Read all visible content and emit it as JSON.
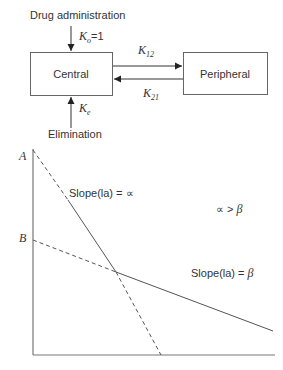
{
  "compartment_model": {
    "input_label": "Drug administration",
    "input_rate": {
      "symbol": "K",
      "subscript": "o",
      "suffix": "=1"
    },
    "central_label": "Central",
    "peripheral_label": "Peripheral",
    "k12": {
      "symbol": "K",
      "subscript": "12"
    },
    "k21": {
      "symbol": "K",
      "subscript": "21"
    },
    "elimination_rate": {
      "symbol": "K",
      "subscript": "e"
    },
    "output_label": "Elimination"
  },
  "plot": {
    "y_intercept_a": "A",
    "y_intercept_b": "B",
    "alpha_slope_label": "Slope(la) = ∝",
    "beta_slope_label_prefix": "Slope(la) = ",
    "beta_symbol": "β",
    "relation_prefix": "∝ > ",
    "relation_symbol": "β"
  },
  "colors": {
    "line": "#555555",
    "text": "#333333",
    "box": "#666666"
  }
}
